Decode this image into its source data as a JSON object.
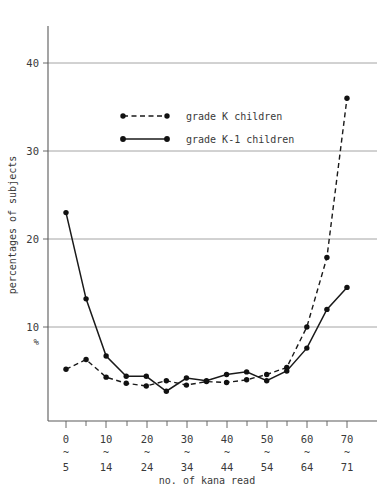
{
  "chart_data": {
    "type": "line",
    "title": "",
    "xlabel": "no. of kana read",
    "ylabel": "percentages of subjects",
    "unit_label": "%",
    "grid": true,
    "legend_position": "upper-left-inside",
    "xlim": [
      0,
      15
    ],
    "ylim": [
      0,
      45
    ],
    "yticks": [
      10,
      20,
      30,
      40
    ],
    "ytick_labels": [
      "10",
      "20",
      "30",
      "40"
    ],
    "categories": [
      "0~5",
      "5~9",
      "10~14",
      "15~19",
      "20~24",
      "25~29",
      "30~34",
      "35~39",
      "40~44",
      "45~49",
      "50~54",
      "55~59",
      "60~64",
      "65~69",
      "70~71"
    ],
    "xtick_labels_top": [
      "0",
      "",
      "10",
      "",
      "20",
      "",
      "30",
      "",
      "40",
      "",
      "50",
      "",
      "60",
      "",
      "70"
    ],
    "xtick_labels_bottom": [
      "5",
      "",
      "14",
      "",
      "24",
      "",
      "34",
      "",
      "44",
      "",
      "54",
      "",
      "64",
      "",
      "71"
    ],
    "xtick_separator": "~",
    "series": [
      {
        "name": "grade K children",
        "style": "dashed",
        "marker": "filled-circle",
        "color": "#111111",
        "values": [
          5.2,
          6.3,
          4.3,
          3.6,
          3.3,
          3.9,
          3.4,
          3.8,
          3.7,
          4.0,
          4.6,
          5.4,
          10.0,
          17.9,
          36.0
        ]
      },
      {
        "name": "grade K-1 children",
        "style": "solid",
        "marker": "filled-circle",
        "color": "#111111",
        "values": [
          23.0,
          13.2,
          6.7,
          4.4,
          4.4,
          2.7,
          4.2,
          3.9,
          4.6,
          4.9,
          3.9,
          5.0,
          7.6,
          12.0,
          14.5
        ]
      }
    ]
  },
  "legend": {
    "items": [
      {
        "label": "grade K children",
        "style": "dashed"
      },
      {
        "label": "grade K-1 children",
        "style": "solid"
      }
    ]
  },
  "axes": {
    "y_title": "percentages of subjects",
    "x_title": "no. of kana read",
    "percent_symbol": "%"
  }
}
